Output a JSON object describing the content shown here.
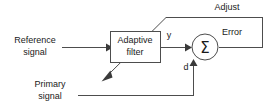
{
  "diagram": {
    "blocks": {
      "adaptive_filter": {
        "line1": "Adaptive",
        "line2": "filter"
      },
      "summing_junction": {
        "symbol": "Σ"
      }
    },
    "labels": {
      "reference_signal_line1": "Reference",
      "reference_signal_line2": "signal",
      "primary_signal_line1": "Primary",
      "primary_signal_line2": "signal",
      "filter_output": "y",
      "desired_signal": "d",
      "error_signal": "Error",
      "adjust_feedback": "Adjust"
    },
    "colors": {
      "background": "#ffffff",
      "wire": "#4d4d4d",
      "text": "#1a1a1a",
      "arrow": "#3a3a3a"
    }
  }
}
